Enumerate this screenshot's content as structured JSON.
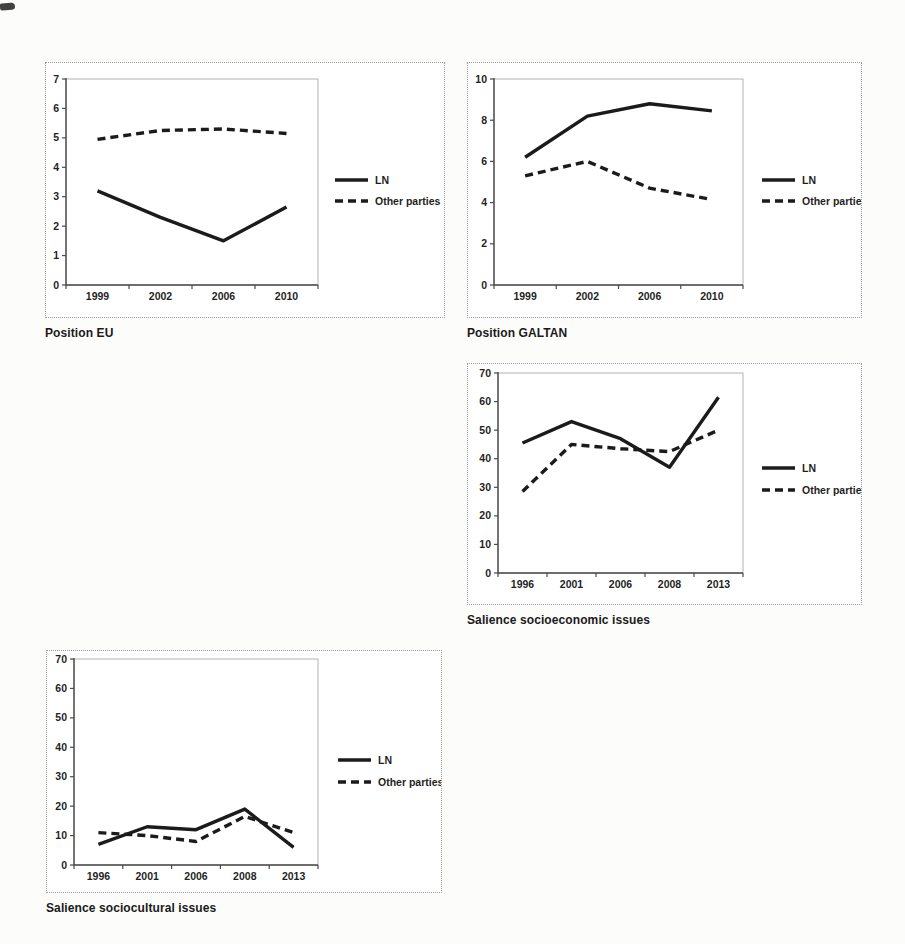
{
  "page": {
    "background": "#fcfcfb",
    "colors": {
      "line": "#1b1b1b",
      "axis": "#4a4a4a",
      "plot_frame": "#b2b2b0",
      "outer_border": "#9c9c9c",
      "tick_text": "#1f1f1f",
      "caption_text": "#1a1a1a"
    }
  },
  "chart_data": [
    {
      "type": "line",
      "title": "Position EU",
      "categories": [
        "1999",
        "2002",
        "2006",
        "2010"
      ],
      "xlabel": "",
      "ylabel": "",
      "ylim": [
        0,
        7
      ],
      "yticks": [
        0,
        1,
        2,
        3,
        4,
        5,
        6,
        7
      ],
      "grid": false,
      "legend_position": "right",
      "series": [
        {
          "name": "LN",
          "line_style": "solid",
          "values": [
            3.2,
            2.3,
            1.5,
            2.65
          ]
        },
        {
          "name": "Other parties",
          "line_style": "dashed",
          "values": [
            4.95,
            5.25,
            5.3,
            5.15
          ]
        }
      ]
    },
    {
      "type": "line",
      "title": "Position GALTAN",
      "categories": [
        "1999",
        "2002",
        "2006",
        "2010"
      ],
      "xlabel": "",
      "ylabel": "",
      "ylim": [
        0,
        10
      ],
      "yticks": [
        0,
        2,
        4,
        6,
        8,
        10
      ],
      "grid": false,
      "legend_position": "right",
      "series": [
        {
          "name": "LN",
          "line_style": "solid",
          "values": [
            6.2,
            8.2,
            8.8,
            8.45
          ]
        },
        {
          "name": "Other parties",
          "line_style": "dashed",
          "values": [
            5.3,
            6.0,
            4.7,
            4.15
          ]
        }
      ]
    },
    {
      "type": "line",
      "title": "Salience socioeconomic issues",
      "categories": [
        "1996",
        "2001",
        "2006",
        "2008",
        "2013"
      ],
      "xlabel": "",
      "ylabel": "",
      "ylim": [
        0,
        70
      ],
      "yticks": [
        0,
        10,
        20,
        30,
        40,
        50,
        60,
        70
      ],
      "grid": false,
      "legend_position": "right",
      "series": [
        {
          "name": "LN",
          "line_style": "solid",
          "values": [
            45.5,
            53,
            47,
            37,
            61.5
          ]
        },
        {
          "name": "Other parties",
          "line_style": "dashed",
          "values": [
            28.5,
            45,
            43.5,
            42.5,
            50
          ]
        }
      ]
    },
    {
      "type": "line",
      "title": "Salience sociocultural issues",
      "categories": [
        "1996",
        "2001",
        "2006",
        "2008",
        "2013"
      ],
      "xlabel": "",
      "ylabel": "",
      "ylim": [
        0,
        70
      ],
      "yticks": [
        0,
        10,
        20,
        30,
        40,
        50,
        60,
        70
      ],
      "grid": false,
      "legend_position": "right",
      "series": [
        {
          "name": "LN",
          "line_style": "solid",
          "values": [
            7,
            13,
            12,
            19,
            6
          ]
        },
        {
          "name": "Other parties",
          "line_style": "dashed",
          "values": [
            11,
            10,
            8,
            16.5,
            11
          ]
        }
      ]
    }
  ]
}
